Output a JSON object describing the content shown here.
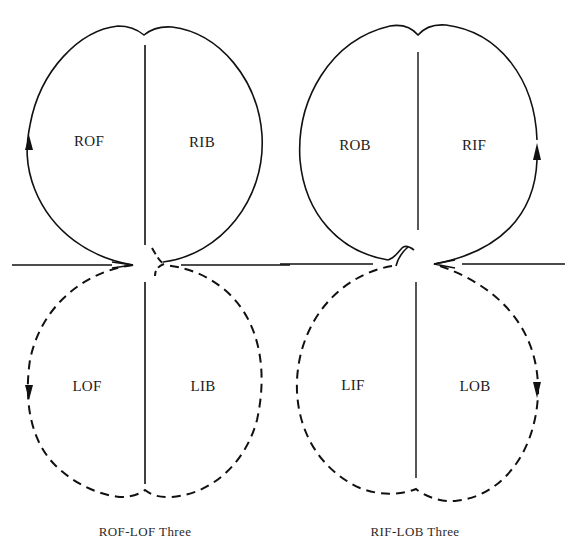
{
  "figures": [
    {
      "caption": "ROF-LOF Three",
      "labels": {
        "top_left": "ROF",
        "top_right": "RIB",
        "bottom_left": "LOF",
        "bottom_right": "LIB"
      }
    },
    {
      "caption": "RIF-LOB Three",
      "labels": {
        "top_left": "ROB",
        "top_right": "RIF",
        "bottom_left": "LIF",
        "bottom_right": "LOB"
      }
    }
  ],
  "colors": {
    "stroke": "#111111",
    "background": "#ffffff"
  }
}
